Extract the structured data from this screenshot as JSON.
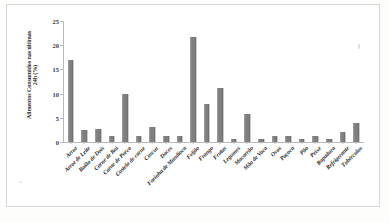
{
  "chart_data": {
    "type": "bar",
    "title": "",
    "subtitle": "",
    "xlabel": "",
    "ylabel": "Alimentos Consumidos nas últimas 24h (%)",
    "ylabel_lines": [
      "Alimentos Consumidos nas últimas",
      "24h (%)"
    ],
    "ylim": [
      0,
      25
    ],
    "yticks": [
      0,
      5,
      10,
      15,
      20,
      25
    ],
    "ytick_labels": [
      "0",
      "5",
      "10",
      "15",
      "20",
      "25"
    ],
    "grid": false,
    "legend": "none",
    "bar_color": "#807f7d",
    "categories": [
      "Arroz",
      "Arroz de Leite",
      "Baião de Dois",
      "Carne de Boi",
      "Carne de Porco",
      "Costela de carne",
      "Cuscuz",
      "Doces",
      "Farinha de Mandioca",
      "Feijão",
      "Frango",
      "Frutas",
      "Legumes",
      "Macarrão",
      "Mão de Vaca",
      "Ovos",
      "Paçoca",
      "Pão",
      "Peixe",
      "Rapadura",
      "Refrigerante",
      "Tubérculos"
    ],
    "values": [
      17.0,
      2.5,
      2.6,
      1.2,
      9.9,
      1.2,
      3.2,
      1.2,
      1.2,
      21.7,
      7.8,
      11.2,
      0.6,
      5.8,
      0.6,
      1.2,
      1.2,
      0.6,
      1.2,
      0.6,
      2.0,
      4.0
    ]
  }
}
